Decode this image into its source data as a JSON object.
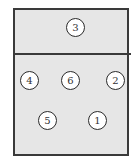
{
  "diagram": {
    "colors": {
      "court_fill": "#e6e6e6",
      "border": "#3a3a3a",
      "circle_fill": "#ffffff"
    },
    "net_zone": {
      "positions": [
        {
          "label": "3",
          "x": 76,
          "y": 28
        }
      ]
    },
    "court_zone": {
      "positions": [
        {
          "label": "4",
          "x": 30,
          "y": 81
        },
        {
          "label": "6",
          "x": 71,
          "y": 81
        },
        {
          "label": "2",
          "x": 116,
          "y": 81
        },
        {
          "label": "5",
          "x": 48,
          "y": 121
        },
        {
          "label": "1",
          "x": 98,
          "y": 121
        }
      ]
    }
  }
}
